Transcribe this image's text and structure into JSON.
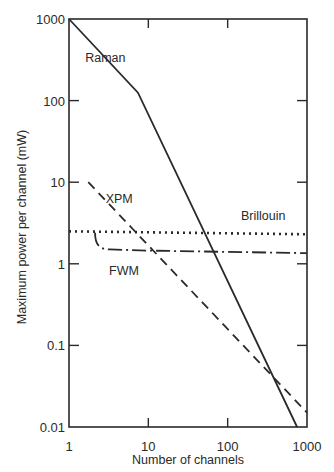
{
  "chart_data": {
    "type": "line",
    "title": "",
    "xlabel": "Number of channels",
    "ylabel": "Maximum power per channel (mW)",
    "xscale": "log",
    "yscale": "log",
    "xlim": [
      1,
      1000
    ],
    "ylim": [
      0.01,
      1000
    ],
    "x_ticks": [
      1,
      10,
      100,
      1000
    ],
    "x_tick_labels": [
      "1",
      "10",
      "100",
      "1000"
    ],
    "y_ticks": [
      0.01,
      0.1,
      1,
      10,
      100,
      1000
    ],
    "y_tick_labels": [
      "0.01",
      "0.1",
      "1",
      "10",
      "100",
      "1000"
    ],
    "grid": false,
    "legend": "none (inline labels)",
    "series": [
      {
        "name": "Raman",
        "style": "solid",
        "x": [
          1,
          7.4,
          750
        ],
        "y": [
          1000,
          125,
          0.01
        ],
        "label_pos": [
          1.6,
          300
        ]
      },
      {
        "name": "XPM",
        "style": "dashed",
        "x": [
          1.75,
          1000
        ],
        "y": [
          10,
          0.015
        ],
        "label_pos": [
          2.9,
          5.5
        ]
      },
      {
        "name": "Brillouin",
        "style": "dotted",
        "x": [
          1,
          1000
        ],
        "y": [
          2.5,
          2.3
        ],
        "label_pos": [
          280,
          3.4
        ]
      },
      {
        "name": "FWM",
        "style": "dash-dot",
        "x": [
          2.13,
          2.3,
          2.7,
          3.3,
          10,
          100,
          1000
        ],
        "y": [
          2.4,
          1.85,
          1.6,
          1.5,
          1.45,
          1.4,
          1.35
        ],
        "label_pos": [
          3.2,
          0.72
        ]
      }
    ]
  },
  "labels": {
    "xlabel": "Number of channels",
    "ylabel": "Maximum power per channel (mW)"
  }
}
